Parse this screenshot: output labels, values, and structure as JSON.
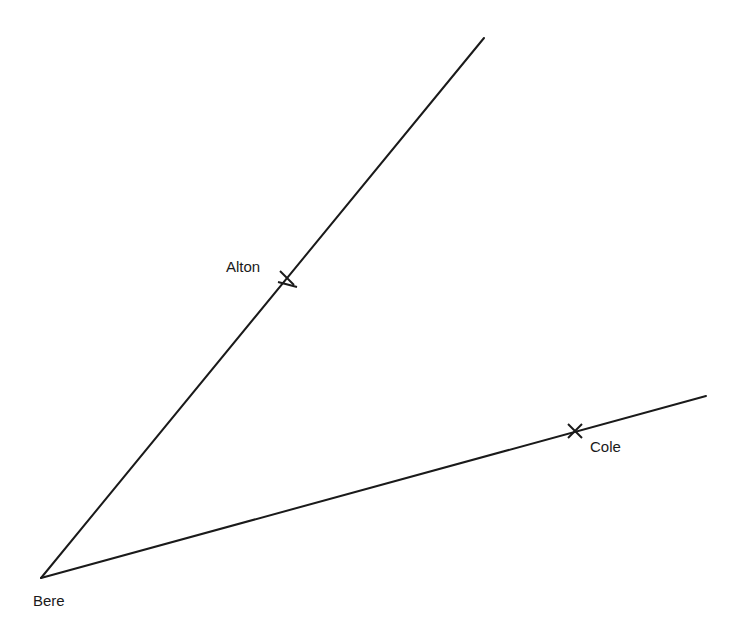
{
  "diagram": {
    "type": "bearing-lines",
    "line_color": "#1a1a1a",
    "points": {
      "bere": {
        "label": "Bere",
        "x": 41,
        "y": 578
      },
      "alton": {
        "label": "Alton",
        "x": 287,
        "y": 278
      },
      "cole": {
        "label": "Cole",
        "x": 575,
        "y": 431
      }
    },
    "lines": [
      {
        "from": "bere",
        "to_x": 484,
        "to_y": 38,
        "through": "alton"
      },
      {
        "from": "bere",
        "to_x": 706,
        "to_y": 396,
        "through": "cole"
      }
    ]
  }
}
